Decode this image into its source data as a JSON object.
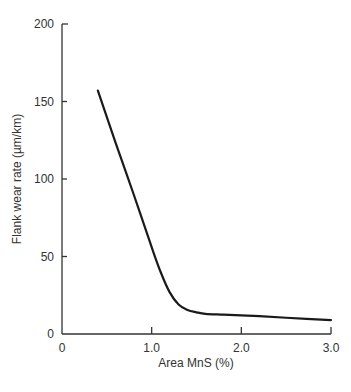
{
  "chart_data": {
    "type": "line",
    "title": "",
    "xlabel": "Area MnS (%)",
    "ylabel": "Flank wear rate (µm/km)",
    "xlim": [
      0,
      3.0
    ],
    "ylim": [
      0,
      200
    ],
    "x_ticks": [
      "0",
      "1.0",
      "2.0",
      "3.0"
    ],
    "y_ticks": [
      "0",
      "50",
      "100",
      "150",
      "200"
    ],
    "grid": false,
    "legend": null,
    "series": [
      {
        "name": "Flank wear rate",
        "x": [
          0.4,
          0.6,
          0.8,
          1.0,
          1.1,
          1.2,
          1.3,
          1.4,
          1.5,
          1.6,
          1.8,
          2.0,
          2.2,
          2.5,
          3.0
        ],
        "values": [
          157,
          123,
          90,
          56,
          40,
          27,
          19,
          15.5,
          14,
          13,
          12.5,
          12,
          11.5,
          10.5,
          9
        ]
      }
    ]
  },
  "axes": {
    "x_tick_labels": [
      "0",
      "1.0",
      "2.0",
      "3.0"
    ],
    "y_tick_labels": [
      "0",
      "50",
      "100",
      "150",
      "200"
    ],
    "xlabel": "Area MnS (%)",
    "ylabel": "Flank wear rate (µm/km)"
  }
}
